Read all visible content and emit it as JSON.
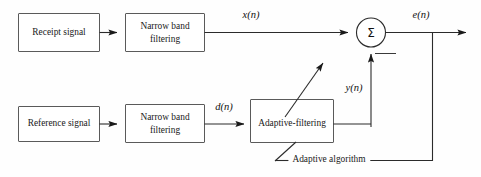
{
  "diagram": {
    "background_color": "#fefefe",
    "line_color": "#2b2b2b",
    "box_stroke_color": "#5a5a5a",
    "box_fill_color": "#ffffff"
  },
  "blocks": {
    "receipt_signal": {
      "line1": "Receipt signal"
    },
    "narrow_band_top": {
      "line1": "Narrow band",
      "line2": "filtering"
    },
    "reference_signal": {
      "line1": "Reference signal"
    },
    "narrow_band_bottom": {
      "line1": "Narrow band",
      "line2": "filtering"
    },
    "adaptive_filtering": {
      "line1": "Adaptive-filtering"
    },
    "summing_node": {
      "symbol": "Σ"
    }
  },
  "signals": {
    "x_n": "x(n)",
    "d_n": "d(n)",
    "y_n": "y(n)",
    "e_n": "e(n)"
  },
  "annotations": {
    "adaptive_algorithm": "Adaptive algorithm"
  }
}
